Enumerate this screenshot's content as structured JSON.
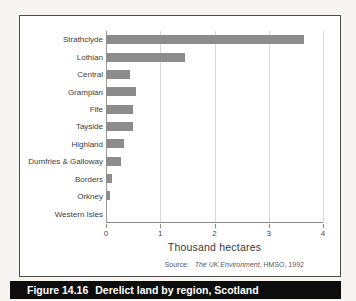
{
  "figure": {
    "label": "Figure 14.16",
    "title": "Derelict land by region, Scotland"
  },
  "source": {
    "prefix": "Source:",
    "book_title": "The UK Environment",
    "suffix": ", HMSO, 1992"
  },
  "colors": {
    "bar": "#8c8c8c",
    "gridline": "#d9d9d9",
    "axis": "#8a8a8a",
    "caption_bg": "#0d0d0d",
    "caption_text": "#ffffff",
    "frame_border": "#4d4d4d"
  },
  "chart_data": {
    "type": "bar",
    "orientation": "horizontal",
    "title": "Derelict land by region, Scotland",
    "xlabel": "Thousand hectares",
    "xlim": [
      0,
      4
    ],
    "xticks": [
      0,
      1,
      2,
      3,
      4
    ],
    "grid": "vertical-gridlines-on",
    "legend": "none",
    "categories": [
      "Strathclyde",
      "Lothian",
      "Central",
      "Grampian",
      "Fife",
      "Tayside",
      "Highland",
      "Dumfries & Galloway",
      "Borders",
      "Orkney",
      "Western Isles"
    ],
    "values": [
      3.65,
      1.45,
      0.45,
      0.55,
      0.5,
      0.5,
      0.33,
      0.27,
      0.11,
      0.07,
      0
    ]
  }
}
